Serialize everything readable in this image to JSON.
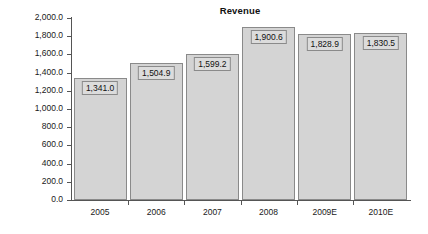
{
  "chart_data": {
    "type": "bar",
    "title": "Revenue",
    "xlabel": "",
    "ylabel": "",
    "categories": [
      "2005",
      "2006",
      "2007",
      "2008",
      "2009E",
      "2010E"
    ],
    "values": [
      1341.0,
      1504.9,
      1599.2,
      1900.6,
      1828.9,
      1830.5
    ],
    "data_labels": [
      "1,341.0",
      "1,504.9",
      "1,599.2",
      "1,900.6",
      "1,828.9",
      "1,830.5"
    ],
    "ylim": [
      0,
      2000
    ],
    "ytick_values": [
      0,
      200,
      400,
      600,
      800,
      1000,
      1200,
      1400,
      1600,
      1800,
      2000
    ],
    "ytick_labels": [
      "0.0",
      "200.0",
      "400.0",
      "600.0",
      "800.0",
      "1,000.0",
      "1,200.0",
      "1,400.0",
      "1,600.0",
      "1,800.0",
      "2,000.0"
    ],
    "grid": false,
    "legend": null,
    "colors": {
      "bar_fill": "#d4d4d4",
      "bar_border": "#8a8a8a",
      "label_box_fill": "#dcdcdc",
      "label_box_border": "#8a8a8a",
      "axis": "#555555",
      "text": "#1a1a1a",
      "background": "#ffffff"
    }
  }
}
